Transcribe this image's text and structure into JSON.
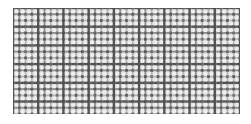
{
  "image": {
    "kind": "photograph",
    "subject": "woven-wire-mesh",
    "caption": "Woven wire mesh screen",
    "width": 251,
    "height": 124,
    "background_color": "#ffffff"
  },
  "mesh": {
    "label": "wire mesh panel",
    "bounds": {
      "x": 13,
      "y": 8,
      "width": 227,
      "height": 106
    },
    "weave": "plain-weave",
    "pitch_px": 6.2,
    "warp_count": 37,
    "weft_count": 18,
    "wire_width_px": 1.9,
    "colors": {
      "wire_dark": "#4a4a4a",
      "wire_mid": "#777777",
      "wire_light": "#9e9e9e",
      "aperture": "#f2f2f2",
      "aperture_alt": "#e8e8e8",
      "shadow": "#c9c9c9",
      "background": "#ffffff"
    },
    "emphasis_period": {
      "warp": 4,
      "weft": 3
    },
    "edge_softness_px": 1.0
  }
}
